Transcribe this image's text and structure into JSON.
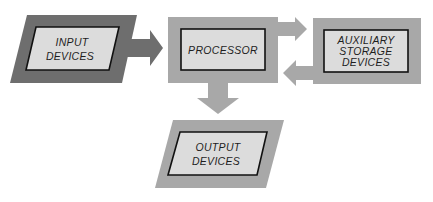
{
  "diagram": {
    "colors": {
      "input_frame": "#6e6e6e",
      "light_frame": "#a8a8a8",
      "inner_fill": "#dcdcdc",
      "inner_border": "#111111",
      "text": "#1e1e1e"
    },
    "nodes": {
      "input": {
        "line1": "INPUT",
        "line2": "DEVICES"
      },
      "processor": {
        "line1": "PROCESSOR"
      },
      "auxiliary": {
        "line1": "AUXILIARY",
        "line2": "STORAGE",
        "line3": "DEVICES"
      },
      "output": {
        "line1": "OUTPUT",
        "line2": "DEVICES"
      }
    },
    "edges": [
      {
        "from": "input",
        "to": "processor"
      },
      {
        "from": "processor",
        "to": "auxiliary"
      },
      {
        "from": "auxiliary",
        "to": "processor"
      },
      {
        "from": "processor",
        "to": "output"
      }
    ]
  }
}
